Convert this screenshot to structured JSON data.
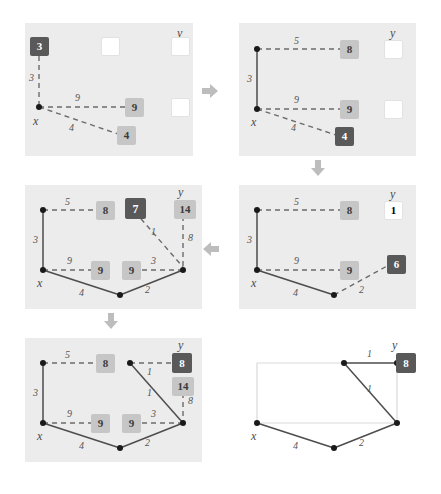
{
  "figure": {
    "colors": {
      "panel_background": "#ececec",
      "badge_dark": "#595959",
      "badge_light": "#c6c6c6",
      "badge_empty": "#ffffff",
      "edge_solid": "#4d4d4d",
      "edge_dashed": "#6b6b6b",
      "edge_faint": "#d9d9d9",
      "arrow": "#bdbdbd",
      "node": "#1a1a1a",
      "text": "#4a4a4a"
    },
    "arrows": [
      {
        "name": "arrow-p1-to-p2",
        "direction": "right"
      },
      {
        "name": "arrow-p2-to-p4",
        "direction": "down"
      },
      {
        "name": "arrow-p4-to-p3",
        "direction": "left"
      },
      {
        "name": "arrow-p3-to-p5",
        "direction": "down"
      }
    ]
  },
  "panels": [
    {
      "id": "panel-1",
      "vertex_labels": [
        {
          "text": "x"
        },
        {
          "text": "y"
        }
      ],
      "edge_labels": [
        {
          "text": "3"
        },
        {
          "text": "9"
        },
        {
          "text": "4"
        }
      ],
      "badges": [
        {
          "text": "3",
          "style": "dark"
        },
        {
          "text": "",
          "style": "empty"
        },
        {
          "text": "",
          "style": "empty"
        },
        {
          "text": "9",
          "style": "light"
        },
        {
          "text": "",
          "style": "empty"
        },
        {
          "text": "4",
          "style": "light"
        }
      ]
    },
    {
      "id": "panel-2",
      "vertex_labels": [
        {
          "text": "x"
        },
        {
          "text": "y"
        }
      ],
      "edge_labels": [
        {
          "text": "5"
        },
        {
          "text": "3"
        },
        {
          "text": "9"
        },
        {
          "text": "4"
        }
      ],
      "badges": [
        {
          "text": "8",
          "style": "light"
        },
        {
          "text": "",
          "style": "empty"
        },
        {
          "text": "9",
          "style": "light"
        },
        {
          "text": "",
          "style": "empty"
        },
        {
          "text": "4",
          "style": "dark"
        }
      ]
    },
    {
      "id": "panel-3",
      "vertex_labels": [
        {
          "text": "x"
        },
        {
          "text": "y"
        }
      ],
      "edge_labels": [
        {
          "text": "5"
        },
        {
          "text": "3"
        },
        {
          "text": "9"
        },
        {
          "text": "4"
        },
        {
          "text": "2"
        },
        {
          "text": "1"
        },
        {
          "text": "8"
        }
      ],
      "badges": [
        {
          "text": "8",
          "style": "light"
        },
        {
          "text": "6",
          "style": "dark"
        }
      ]
    },
    {
      "id": "panel-4",
      "vertex_labels": [
        {
          "text": "x"
        },
        {
          "text": "y"
        }
      ],
      "edge_labels": [
        {
          "text": "5"
        },
        {
          "text": "3"
        },
        {
          "text": "9"
        },
        {
          "text": "3"
        },
        {
          "text": "4"
        },
        {
          "text": "2"
        },
        {
          "text": "1"
        },
        {
          "text": "8"
        }
      ],
      "badges": [
        {
          "text": "8",
          "style": "light"
        },
        {
          "text": "7",
          "style": "dark"
        },
        {
          "text": "14",
          "style": "light"
        },
        {
          "text": "9",
          "style": "light"
        },
        {
          "text": "9",
          "style": "light"
        }
      ]
    },
    {
      "id": "panel-5",
      "vertex_labels": [
        {
          "text": "x"
        },
        {
          "text": "y"
        }
      ],
      "edge_labels": [
        {
          "text": "5"
        },
        {
          "text": "3"
        },
        {
          "text": "1"
        },
        {
          "text": "1"
        },
        {
          "text": "9"
        },
        {
          "text": "3"
        },
        {
          "text": "8"
        },
        {
          "text": "4"
        },
        {
          "text": "2"
        }
      ],
      "badges": [
        {
          "text": "8",
          "style": "light"
        },
        {
          "text": "8",
          "style": "dark"
        },
        {
          "text": "14",
          "style": "light"
        },
        {
          "text": "9",
          "style": "light"
        },
        {
          "text": "9",
          "style": "light"
        }
      ]
    },
    {
      "id": "panel-6",
      "vertex_labels": [
        {
          "text": "x"
        },
        {
          "text": "y"
        }
      ],
      "edge_labels": [
        {
          "text": "1"
        },
        {
          "text": "1"
        },
        {
          "text": "4"
        },
        {
          "text": "2"
        }
      ],
      "badges": [
        {
          "text": "8",
          "style": "dark"
        }
      ]
    }
  ]
}
